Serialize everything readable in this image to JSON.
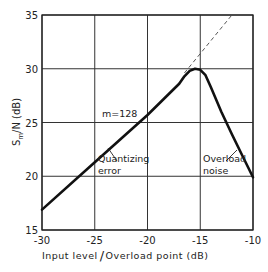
{
  "chart_data": {
    "type": "line",
    "title": "",
    "xlabel": "Input level / Overload point (dB)",
    "ylabel": "Sm/N (dB)",
    "xlim": [
      -30,
      -10
    ],
    "ylim": [
      15,
      35
    ],
    "grid": true,
    "xticks": [
      -30,
      -25,
      -20,
      -15,
      -10
    ],
    "yticks": [
      15,
      20,
      25,
      30,
      35
    ],
    "xtick_labels": [
      "-30",
      "-25",
      "-20",
      "-15",
      "-10"
    ],
    "ytick_labels": [
      "15",
      "20",
      "25",
      "30",
      "35"
    ],
    "series": [
      {
        "name": "m=128",
        "style": "solid-thick",
        "x": [
          -30,
          -25,
          -20,
          -17,
          -16.5,
          -16,
          -15.5,
          -15,
          -14.5,
          -14,
          -13,
          -12,
          -11,
          -10
        ],
        "y": [
          16.9,
          21.3,
          25.7,
          28.6,
          29.3,
          29.8,
          30.0,
          29.9,
          29.4,
          28.3,
          26.0,
          23.9,
          21.9,
          19.9
        ]
      },
      {
        "name": "extrapolated quantizing-noise line",
        "style": "dashed",
        "x": [
          -16.5,
          -12
        ],
        "y": [
          29.6,
          35.0
        ]
      }
    ],
    "annotations": [
      {
        "text": "m=128",
        "x": -24.3,
        "y": 25.9
      },
      {
        "text": "Quantizing",
        "x": -24.7,
        "y": 21.8
      },
      {
        "text": "error",
        "x": -24.7,
        "y": 20.4
      },
      {
        "text": "Overload",
        "x": -15.3,
        "y": 21.8
      },
      {
        "text": "noise",
        "x": -15.3,
        "y": 20.4
      }
    ],
    "ylabel_parts": {
      "main": "S",
      "sub": "m",
      "rest": "/N  (dB)"
    },
    "xlabel_parts": {
      "left": "Input level",
      "slash": "/",
      "right": "Overload point (dB)"
    }
  }
}
